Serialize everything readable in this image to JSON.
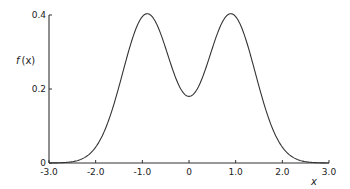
{
  "chart_data": {
    "type": "line",
    "title": "",
    "xlabel": "x",
    "ylabel": "f (x)",
    "xlim": [
      -3.0,
      3.0
    ],
    "ylim": [
      0,
      0.4
    ],
    "grid": false,
    "legend": null,
    "x_ticks": [
      "-3.0",
      "-2.0",
      "-1.0",
      "0",
      "1.0",
      "2.0",
      "3.0"
    ],
    "x_tick_values": [
      -3,
      -2,
      -1,
      0,
      1,
      2,
      3
    ],
    "y_ticks": [
      "0",
      "0.2",
      "0.4"
    ],
    "y_tick_values": [
      0,
      0.2,
      0.4
    ],
    "series": [
      {
        "name": "f(x)",
        "description": "bimodal symmetric density (sum of two Gaussians)",
        "model": {
          "amplitude": 0.4025,
          "mean": 0.9,
          "sigma": 0.52
        },
        "x": [
          -3.0,
          -2.5,
          -2.0,
          -1.5,
          -1.2,
          -0.9,
          -0.6,
          -0.3,
          0.0,
          0.3,
          0.6,
          0.9,
          1.2,
          1.5,
          2.0,
          2.5,
          3.0
        ],
        "values": [
          0.0,
          0.004,
          0.043,
          0.206,
          0.341,
          0.403,
          0.341,
          0.233,
          0.18,
          0.233,
          0.341,
          0.403,
          0.341,
          0.206,
          0.043,
          0.004,
          0.0
        ]
      }
    ],
    "annotations": {
      "peaks": [
        [
          -0.87,
          0.4
        ],
        [
          0.87,
          0.4
        ]
      ],
      "minimum": [
        0.0,
        0.18
      ]
    }
  },
  "labels": {
    "ylabel_f": "f",
    "ylabel_x": "(x)",
    "xlabel": "x"
  }
}
